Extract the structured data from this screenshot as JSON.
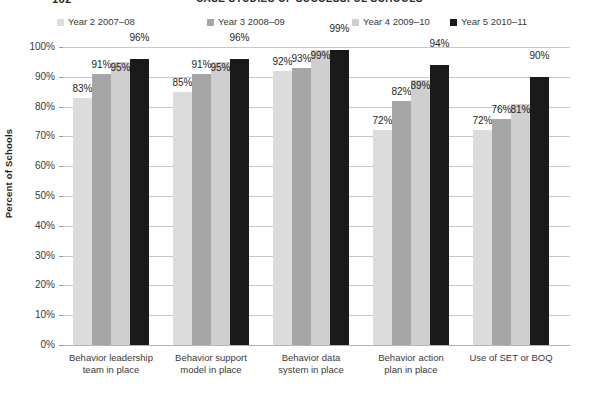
{
  "header": {
    "page_number": "162",
    "title": "CASE STUDIES OF SUCCESSFUL SCHOOLS"
  },
  "legend": {
    "items": [
      {
        "label": "Year 2 2007–08",
        "color": "#dcdcdc"
      },
      {
        "label": "Year 3 2008–09",
        "color": "#a6a6a6"
      },
      {
        "label": "Year 4 2009–10",
        "color": "#cfcfcf"
      },
      {
        "label": "Year 5 2010–11",
        "color": "#1a1a1a"
      }
    ]
  },
  "chart_data": {
    "type": "bar",
    "title": "CASE STUDIES OF SUCCESSFUL SCHOOLS",
    "xlabel": "",
    "ylabel": "Percent of Schools",
    "ylim": [
      0,
      100
    ],
    "ytick_labels": [
      "0%",
      "10%",
      "20%",
      "30%",
      "40%",
      "50%",
      "60%",
      "70%",
      "80%",
      "90%",
      "100%"
    ],
    "ytick_values": [
      0,
      10,
      20,
      30,
      40,
      50,
      60,
      70,
      80,
      90,
      100
    ],
    "grid": true,
    "legend_position": "top",
    "value_suffix": "%",
    "categories": [
      "Behavior leadership team in place",
      "Behavior support model in place",
      "Behavior data system in place",
      "Behavior action plan in place",
      "Use of SET or BOQ"
    ],
    "categories_lines": [
      [
        "Behavior leadership",
        "team in place"
      ],
      [
        "Behavior support",
        "model in place"
      ],
      [
        "Behavior data",
        "system in place"
      ],
      [
        "Behavior action",
        "plan in place"
      ],
      [
        "Use of SET or BOQ",
        ""
      ]
    ],
    "series": [
      {
        "name": "Year 2 2007–08",
        "color": "#dcdcdc",
        "values": [
          83,
          85,
          92,
          72,
          72
        ],
        "labels": [
          "83%",
          "85%",
          "92%",
          "72%",
          "72%"
        ]
      },
      {
        "name": "Year 3 2008–09",
        "color": "#a6a6a6",
        "values": [
          91,
          91,
          93,
          82,
          76
        ],
        "labels": [
          "91%",
          "91%",
          "93%",
          "82%",
          "76%"
        ]
      },
      {
        "name": "Year 4 2009–10",
        "color": "#cfcfcf",
        "values": [
          95,
          95,
          99,
          89,
          81
        ],
        "labels": [
          "95%",
          "95%",
          "99%",
          "89%",
          "81%"
        ]
      },
      {
        "name": "Year 5 2010–11",
        "color": "#1a1a1a",
        "values": [
          96,
          96,
          99,
          94,
          90
        ],
        "labels": [
          "96%",
          "96%",
          "99%",
          "94%",
          "90%"
        ]
      }
    ]
  }
}
